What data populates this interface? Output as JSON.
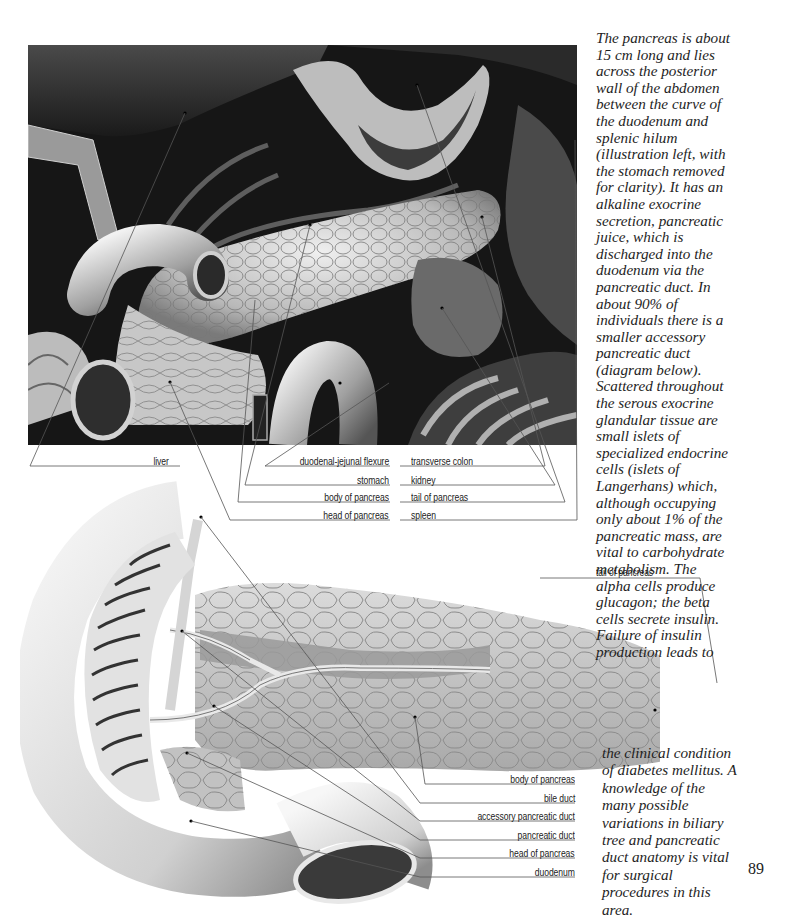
{
  "page": {
    "number": "89"
  },
  "figures": {
    "top_photo": {
      "description": "Dissection view of abdomen with stomach removed showing pancreas in situ",
      "labels_left": [
        {
          "text": "liver"
        },
        {
          "text": "duodenal-jejunal flexure"
        },
        {
          "text": "stomach"
        },
        {
          "text": "body of pancreas"
        },
        {
          "text": "head of pancreas"
        }
      ],
      "labels_right": [
        {
          "text": "transverse colon"
        },
        {
          "text": "kidney"
        },
        {
          "text": "tail of pancreas"
        },
        {
          "text": "spleen"
        }
      ]
    },
    "bottom_illustration": {
      "description": "Drawing of pancreas and duodenum showing ducts",
      "top_label": "tail of pancreas",
      "labels": [
        {
          "text": "body of pancreas"
        },
        {
          "text": "bile duct"
        },
        {
          "text": "accessory pancreatic duct"
        },
        {
          "text": "pancreatic duct"
        },
        {
          "text": "head of pancreas"
        },
        {
          "text": "duodenum"
        }
      ]
    }
  },
  "text": {
    "column_top": [
      "The pancreas is about",
      "15 cm long and lies",
      "across the posterior",
      "wall of the abdomen",
      "between the curve of",
      "the duodenum and",
      "splenic hilum",
      "(illustration left, with",
      "the stomach removed",
      "for clarity). It has an",
      "alkaline exocrine",
      "secretion, pancreatic",
      "juice, which is",
      "discharged into the",
      "duodenum via the",
      "pancreatic duct. In",
      "about 90% of",
      "individuals there is a",
      "smaller accessory",
      "pancreatic duct",
      "(diagram below).",
      "Scattered throughout",
      "the serous exocrine",
      "glandular tissue are",
      "small islets of",
      "specialized endocrine",
      "cells (islets of",
      "Langerhans) which,",
      "although occupying",
      "only about 1% of the",
      "pancreatic mass, are",
      "vital to carbohydrate",
      "metabolism. The",
      "alpha cells produce",
      "glucagon; the beta",
      "cells secrete insulin.",
      "Failure of insulin",
      "production leads to"
    ],
    "column_bottom": [
      "the clinical condition",
      "of diabetes mellitus. A",
      "knowledge of the",
      "many possible",
      "variations in biliary",
      "tree and pancreatic",
      "duct anatomy is vital",
      "for surgical",
      "procedures in this",
      "area."
    ]
  },
  "colors": {
    "ink": "#222222",
    "leader": "#555555",
    "photo_dark": "#141414",
    "pancreas_light": "#d8d8d8",
    "illus_gray": "#a8a8a8"
  }
}
